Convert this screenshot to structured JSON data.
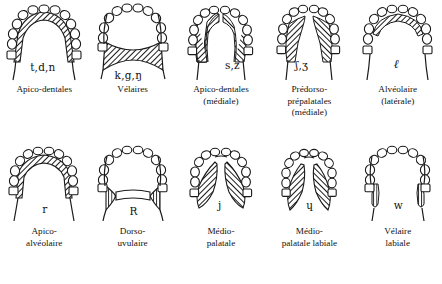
{
  "figure": {
    "rows": [
      {
        "cells": [
          {
            "id": "apico-dentales",
            "ipa": "t,d,n",
            "caption": "Apico-dentales",
            "pattern": "apico-dental",
            "ipa_x": 30,
            "ipa_y": 62
          },
          {
            "id": "velaires",
            "ipa": "k,g,ŋ",
            "caption": "Vélaires",
            "pattern": "velar",
            "ipa_x": 26,
            "ipa_y": 70
          },
          {
            "id": "apico-dentales-mediale",
            "ipa": "s,z",
            "caption": "Apico-dentales\n(médiale)",
            "pattern": "apico-dental-medial",
            "ipa_x": 48,
            "ipa_y": 60
          },
          {
            "id": "predorso-prepalatales-mediale",
            "ipa": "ʃ,ʒ",
            "caption": "Prédorso-\nprépalatales\n(médiale)",
            "pattern": "predorso-prepalatal",
            "ipa_x": 30,
            "ipa_y": 60
          },
          {
            "id": "alveolaire-laterale",
            "ipa": "ℓ",
            "caption": "Alvéolaire\n(latérale)",
            "pattern": "alveolar-lateral",
            "ipa_x": 40,
            "ipa_y": 60
          }
        ]
      },
      {
        "cells": [
          {
            "id": "apico-alveolaire",
            "ipa": "r",
            "caption": "Apico-\nalvéolaire",
            "pattern": "apico-alveolar",
            "ipa_x": 42,
            "ipa_y": 64
          },
          {
            "id": "dorso-uvulaire",
            "ipa": "R",
            "caption": "Dorso-\nuvulaire",
            "pattern": "dorso-uvular",
            "ipa_x": 41,
            "ipa_y": 66
          },
          {
            "id": "medio-palatale",
            "ipa": "j",
            "caption": "Médio-\npalatale",
            "pattern": "medio-palatal",
            "ipa_x": 41,
            "ipa_y": 60
          },
          {
            "id": "medio-palatale-labiale",
            "ipa": "ɥ",
            "caption": "Médio-\npalatale labiale",
            "pattern": "medio-palatal-labial",
            "ipa_x": 41,
            "ipa_y": 60
          },
          {
            "id": "velaire-labiale",
            "ipa": "w",
            "caption": "Vélaire\nlabiale",
            "pattern": "velar-labial",
            "ipa_x": 40,
            "ipa_y": 60
          }
        ]
      }
    ]
  },
  "colors": {
    "ink": "#1a1a1a",
    "paper": "#ffffff",
    "hatch": "#3a3a3a"
  }
}
